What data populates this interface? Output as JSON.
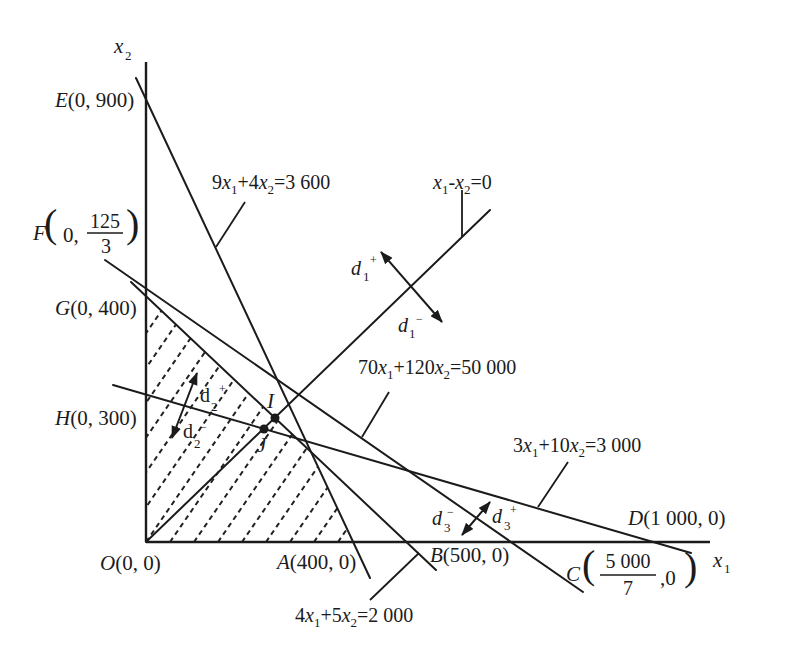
{
  "axes": {
    "x": {
      "var": "x",
      "sub": "1"
    },
    "y": {
      "var": "x",
      "sub": "2"
    }
  },
  "points": {
    "E": {
      "letter": "E",
      "coords": "(0, 900)"
    },
    "F": {
      "letter": "F",
      "open": "(",
      "pre": "0,",
      "num": "125",
      "den": "3",
      "close": ")"
    },
    "G": {
      "letter": "G",
      "coords": "(0, 400)"
    },
    "H": {
      "letter": "H",
      "coords": "(0, 300)"
    },
    "O": {
      "letter": "O",
      "coords": "(0, 0)"
    },
    "A": {
      "letter": "A",
      "coords": "(400, 0)"
    },
    "B": {
      "letter": "B",
      "coords": "(500, 0)"
    },
    "C": {
      "letter": "C",
      "open": "(",
      "num": "5 000",
      "den": "7",
      "post": ",0",
      "close": ")"
    },
    "D": {
      "letter": "D",
      "coords": "(1 000, 0)"
    },
    "I": {
      "letter": "I"
    },
    "J": {
      "letter": "J"
    }
  },
  "constraints": [
    {
      "label": "9x1+4x2=3 600",
      "a": "9",
      "v1": "x",
      "s1": "1",
      "op": "+",
      "b": "4",
      "v2": "x",
      "s2": "2",
      "rhs": "=3 600"
    },
    {
      "label": "x1-x2=0",
      "a": "",
      "v1": "x",
      "s1": "1",
      "op": "-",
      "b": "",
      "v2": "x",
      "s2": "2",
      "rhs": "=0"
    },
    {
      "label": "70x1+120x2=50 000",
      "a": "70",
      "v1": "x",
      "s1": "1",
      "op": "+",
      "b": "120",
      "v2": "x",
      "s2": "2",
      "rhs": "=50 000"
    },
    {
      "label": "3x1+10x2=3 000",
      "a": "3",
      "v1": "x",
      "s1": "1",
      "op": "+",
      "b": "10",
      "v2": "x",
      "s2": "2",
      "rhs": "=3 000"
    },
    {
      "label": "4x1+5x2=2 000",
      "a": "4",
      "v1": "x",
      "s1": "1",
      "op": "+",
      "b": "5",
      "v2": "x",
      "s2": "2",
      "rhs": "=2 000"
    }
  ],
  "deviations": [
    {
      "d": "d",
      "sub": "1",
      "sup": "+"
    },
    {
      "d": "d",
      "sub": "1",
      "sup": "−"
    },
    {
      "d": "d",
      "sub": "2",
      "sup": "+"
    },
    {
      "d": "d",
      "sub": "2",
      "sup": "−"
    },
    {
      "d": "d",
      "sub": "3",
      "sup": "−"
    },
    {
      "d": "d",
      "sub": "3",
      "sup": "+"
    }
  ],
  "colors": {
    "ink": "#1b1b1b",
    "background": "#ffffff"
  }
}
